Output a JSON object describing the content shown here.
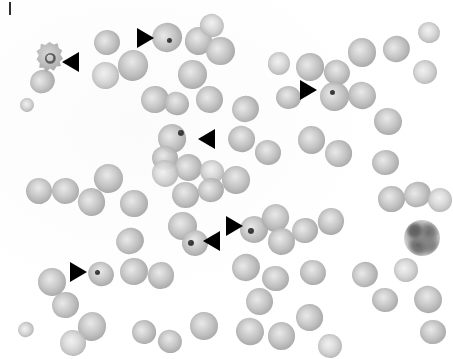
{
  "figure": {
    "kind": "light-microscopy-micrograph",
    "width_px": 453,
    "height_px": 359,
    "background_color": "#fdfdfd",
    "cell_fill_color": "#b9b9b9",
    "cell_rim_color": "#acacac",
    "inclusion_color": "#303030",
    "marker_color": "#000000",
    "marker_count": 7
  },
  "markers": [
    {
      "id": "marker-1",
      "name": "arrowhead-crenated-cell",
      "direction": "left",
      "x": 62,
      "y": 52,
      "target": "crenated cell with dark ring inclusion"
    },
    {
      "id": "marker-2",
      "name": "arrowhead-top-inclusion",
      "direction": "right",
      "x": 137,
      "y": 28,
      "target": "cell with dark punctate inclusion"
    },
    {
      "id": "marker-3",
      "name": "arrowhead-upper-right-inclusion",
      "direction": "right",
      "x": 300,
      "y": 80,
      "target": "cell with dark punctate inclusion"
    },
    {
      "id": "marker-4",
      "name": "arrowhead-center-inclusion",
      "direction": "left",
      "x": 198,
      "y": 129,
      "target": "cell with dark inclusion"
    },
    {
      "id": "marker-5",
      "name": "arrowhead-mid-right-inclusion",
      "direction": "right",
      "x": 226,
      "y": 216,
      "target": "cell with dark punctate inclusion"
    },
    {
      "id": "marker-6",
      "name": "arrowhead-mid-left-inclusion",
      "direction": "left",
      "x": 203,
      "y": 231,
      "target": "cell with dark punctate inclusion"
    },
    {
      "id": "marker-7",
      "name": "arrowhead-lower-left-inclusion",
      "direction": "right",
      "x": 70,
      "y": 262,
      "target": "cell with dark inclusion"
    }
  ],
  "scale_tick": {
    "name": "corner-tick-mark",
    "x": 9,
    "y": 2,
    "width": 2,
    "height": 13
  },
  "special_cells": [
    {
      "name": "crenated-cell",
      "x": 36,
      "y": 42,
      "size": 27,
      "note": "irregular spiculated outline, dark ring inside"
    },
    {
      "name": "stained-leukocyte",
      "x": 404,
      "y": 220,
      "size": 36,
      "note": "darkly granular nucleated cell at right side"
    }
  ],
  "cells": [
    {
      "x": 30,
      "y": 70,
      "d": 25,
      "tone": "normal"
    },
    {
      "x": 20,
      "y": 98,
      "d": 14,
      "tone": "pale",
      "clip": "left-edge"
    },
    {
      "x": 94,
      "y": 30,
      "d": 26,
      "tone": "normal"
    },
    {
      "x": 118,
      "y": 50,
      "d": 30,
      "tone": "normal"
    },
    {
      "x": 92,
      "y": 62,
      "d": 27,
      "tone": "pale"
    },
    {
      "x": 152,
      "y": 23,
      "d": 30,
      "tone": "normal"
    },
    {
      "x": 185,
      "y": 27,
      "d": 27,
      "tone": "normal"
    },
    {
      "x": 206,
      "y": 37,
      "d": 29,
      "tone": "normal"
    },
    {
      "x": 200,
      "y": 14,
      "d": 24,
      "tone": "pale"
    },
    {
      "x": 178,
      "y": 60,
      "d": 29,
      "tone": "normal"
    },
    {
      "x": 141,
      "y": 86,
      "d": 28,
      "tone": "normal"
    },
    {
      "x": 164,
      "y": 92,
      "d": 25,
      "tone": "normal"
    },
    {
      "x": 196,
      "y": 86,
      "d": 27,
      "tone": "normal"
    },
    {
      "x": 232,
      "y": 96,
      "d": 27,
      "tone": "normal"
    },
    {
      "x": 268,
      "y": 52,
      "d": 22,
      "tone": "pale",
      "clip": "top"
    },
    {
      "x": 296,
      "y": 53,
      "d": 28,
      "tone": "normal"
    },
    {
      "x": 324,
      "y": 60,
      "d": 26,
      "tone": "normal"
    },
    {
      "x": 348,
      "y": 38,
      "d": 28,
      "tone": "normal"
    },
    {
      "x": 383,
      "y": 36,
      "d": 27,
      "tone": "normal"
    },
    {
      "x": 418,
      "y": 22,
      "d": 22,
      "tone": "pale",
      "clip": "top"
    },
    {
      "x": 320,
      "y": 82,
      "d": 29,
      "tone": "normal"
    },
    {
      "x": 348,
      "y": 82,
      "d": 28,
      "tone": "normal"
    },
    {
      "x": 276,
      "y": 86,
      "d": 25,
      "tone": "normal"
    },
    {
      "x": 413,
      "y": 60,
      "d": 24,
      "tone": "pale",
      "clip": "right-edge"
    },
    {
      "x": 374,
      "y": 108,
      "d": 28,
      "tone": "normal"
    },
    {
      "x": 298,
      "y": 126,
      "d": 27,
      "tone": "normal"
    },
    {
      "x": 325,
      "y": 140,
      "d": 27,
      "tone": "normal"
    },
    {
      "x": 255,
      "y": 140,
      "d": 26,
      "tone": "normal"
    },
    {
      "x": 158,
      "y": 124,
      "d": 28,
      "tone": "normal"
    },
    {
      "x": 228,
      "y": 126,
      "d": 27,
      "tone": "normal"
    },
    {
      "x": 152,
      "y": 146,
      "d": 26,
      "tone": "normal"
    },
    {
      "x": 175,
      "y": 154,
      "d": 27,
      "tone": "normal"
    },
    {
      "x": 200,
      "y": 160,
      "d": 24,
      "tone": "pale"
    },
    {
      "x": 372,
      "y": 150,
      "d": 27,
      "tone": "normal"
    },
    {
      "x": 26,
      "y": 178,
      "d": 26,
      "tone": "normal"
    },
    {
      "x": 52,
      "y": 178,
      "d": 27,
      "tone": "normal"
    },
    {
      "x": 78,
      "y": 188,
      "d": 27,
      "tone": "normal"
    },
    {
      "x": 94,
      "y": 164,
      "d": 29,
      "tone": "normal"
    },
    {
      "x": 120,
      "y": 190,
      "d": 28,
      "tone": "normal"
    },
    {
      "x": 152,
      "y": 160,
      "d": 26,
      "tone": "pale",
      "clip": "none"
    },
    {
      "x": 172,
      "y": 182,
      "d": 27,
      "tone": "normal"
    },
    {
      "x": 198,
      "y": 178,
      "d": 26,
      "tone": "normal"
    },
    {
      "x": 222,
      "y": 166,
      "d": 28,
      "tone": "normal"
    },
    {
      "x": 168,
      "y": 212,
      "d": 29,
      "tone": "normal"
    },
    {
      "x": 116,
      "y": 228,
      "d": 28,
      "tone": "normal"
    },
    {
      "x": 182,
      "y": 230,
      "d": 26,
      "tone": "normal"
    },
    {
      "x": 240,
      "y": 216,
      "d": 28,
      "tone": "normal"
    },
    {
      "x": 262,
      "y": 204,
      "d": 27,
      "tone": "normal"
    },
    {
      "x": 268,
      "y": 228,
      "d": 27,
      "tone": "normal"
    },
    {
      "x": 292,
      "y": 218,
      "d": 26,
      "tone": "normal"
    },
    {
      "x": 318,
      "y": 208,
      "d": 26,
      "tone": "normal"
    },
    {
      "x": 378,
      "y": 186,
      "d": 27,
      "tone": "normal"
    },
    {
      "x": 404,
      "y": 182,
      "d": 27,
      "tone": "normal"
    },
    {
      "x": 428,
      "y": 188,
      "d": 24,
      "tone": "pale",
      "clip": "right-edge"
    },
    {
      "x": 120,
      "y": 258,
      "d": 28,
      "tone": "normal"
    },
    {
      "x": 88,
      "y": 262,
      "d": 26,
      "tone": "normal"
    },
    {
      "x": 38,
      "y": 268,
      "d": 28,
      "tone": "normal"
    },
    {
      "x": 52,
      "y": 292,
      "d": 27,
      "tone": "normal"
    },
    {
      "x": 78,
      "y": 312,
      "d": 28,
      "tone": "normal"
    },
    {
      "x": 60,
      "y": 330,
      "d": 26,
      "tone": "pale"
    },
    {
      "x": 18,
      "y": 322,
      "d": 16,
      "tone": "pale",
      "clip": "left-edge"
    },
    {
      "x": 148,
      "y": 262,
      "d": 26,
      "tone": "normal"
    },
    {
      "x": 132,
      "y": 320,
      "d": 24,
      "tone": "normal"
    },
    {
      "x": 158,
      "y": 330,
      "d": 24,
      "tone": "normal"
    },
    {
      "x": 190,
      "y": 312,
      "d": 28,
      "tone": "normal"
    },
    {
      "x": 232,
      "y": 254,
      "d": 28,
      "tone": "normal"
    },
    {
      "x": 262,
      "y": 266,
      "d": 27,
      "tone": "normal"
    },
    {
      "x": 246,
      "y": 288,
      "d": 27,
      "tone": "normal"
    },
    {
      "x": 236,
      "y": 318,
      "d": 28,
      "tone": "normal"
    },
    {
      "x": 268,
      "y": 322,
      "d": 27,
      "tone": "normal"
    },
    {
      "x": 296,
      "y": 304,
      "d": 27,
      "tone": "normal"
    },
    {
      "x": 300,
      "y": 260,
      "d": 26,
      "tone": "normal"
    },
    {
      "x": 318,
      "y": 334,
      "d": 24,
      "tone": "pale",
      "clip": "bottom"
    },
    {
      "x": 352,
      "y": 262,
      "d": 26,
      "tone": "normal"
    },
    {
      "x": 372,
      "y": 288,
      "d": 26,
      "tone": "normal"
    },
    {
      "x": 394,
      "y": 258,
      "d": 24,
      "tone": "pale"
    },
    {
      "x": 414,
      "y": 286,
      "d": 28,
      "tone": "normal"
    },
    {
      "x": 420,
      "y": 320,
      "d": 26,
      "tone": "normal"
    }
  ],
  "inclusions": [
    {
      "x": 167,
      "y": 38,
      "d": 5
    },
    {
      "x": 330,
      "y": 90,
      "d": 5
    },
    {
      "x": 178,
      "y": 130,
      "d": 6
    },
    {
      "x": 248,
      "y": 228,
      "d": 6
    },
    {
      "x": 188,
      "y": 240,
      "d": 6
    },
    {
      "x": 95,
      "y": 270,
      "d": 5
    }
  ]
}
